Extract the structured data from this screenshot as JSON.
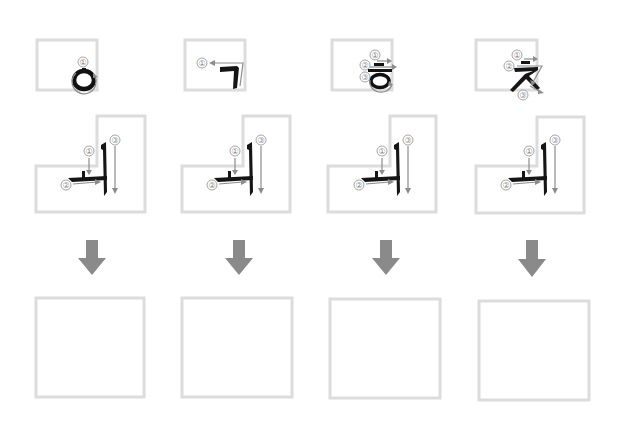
{
  "worksheet": {
    "title": "Korean syllable stroke-order practice",
    "colors": {
      "box_border": "#dcdcdc",
      "guide_arrow": "#8c8c8c",
      "ink": "#151515",
      "down_arrow": "#8a8a8a"
    },
    "columns": [
      {
        "initial_consonant": "ㅇ",
        "initial_strokes": [
          "①"
        ],
        "vowel": "ㅢ",
        "vowel_strokes": [
          "①",
          "②",
          "③"
        ],
        "answer_box": ""
      },
      {
        "initial_consonant": "ㄱ",
        "initial_strokes": [
          "①"
        ],
        "vowel": "ㅢ",
        "vowel_strokes": [
          "①",
          "②",
          "③"
        ],
        "answer_box": ""
      },
      {
        "initial_consonant": "ㅎ",
        "initial_strokes": [
          "①",
          "②",
          "③"
        ],
        "vowel": "ㅢ",
        "vowel_strokes": [
          "①",
          "②",
          "③"
        ],
        "answer_box": ""
      },
      {
        "initial_consonant": "ㅊ",
        "initial_strokes": [
          "①",
          "②",
          "③"
        ],
        "vowel": "ㅢ",
        "vowel_strokes": [
          "①",
          "②",
          "③"
        ],
        "answer_box": ""
      }
    ],
    "arrow_icon": "down-arrow-icon"
  }
}
